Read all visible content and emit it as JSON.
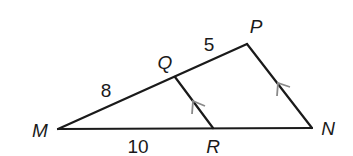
{
  "diagram": {
    "type": "triangle-with-parallel-segment",
    "line_color": "#1a1a1a",
    "arrow_color": "#8a8a8a",
    "points": {
      "M": {
        "label": "M",
        "x": 58,
        "y": 129
      },
      "N": {
        "label": "N",
        "x": 312,
        "y": 128
      },
      "P": {
        "label": "P",
        "x": 247,
        "y": 44
      },
      "Q": {
        "label": "Q",
        "x": 175,
        "y": 77
      },
      "R": {
        "label": "R",
        "x": 213,
        "y": 128
      }
    },
    "segments": [
      {
        "from": "M",
        "to": "P"
      },
      {
        "from": "M",
        "to": "N"
      },
      {
        "from": "P",
        "to": "N"
      },
      {
        "from": "Q",
        "to": "R"
      }
    ],
    "parallel_marks": [
      {
        "segment": "QR",
        "mark": "single-arrow"
      },
      {
        "segment": "NP",
        "mark": "single-arrow"
      }
    ],
    "lengths": {
      "MQ": "8",
      "QP": "5",
      "MR": "10"
    }
  }
}
